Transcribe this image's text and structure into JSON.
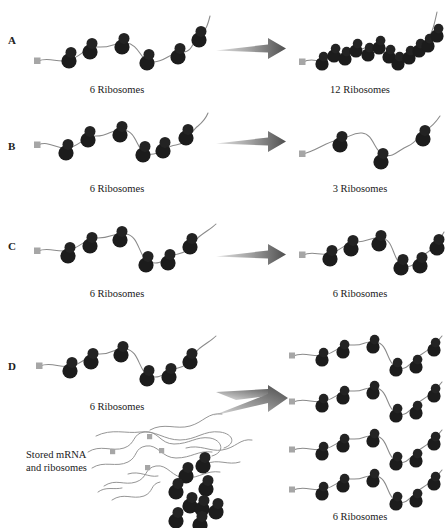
{
  "figure": {
    "background": "#ffffff",
    "ink_color": "#1a1a1a",
    "mrna_color": "#8a8a8a",
    "ribosome_color": "#1c1c1c",
    "cap_color": "#a6a6a6",
    "arrow_color_light": "#d8d8d8",
    "arrow_color_dark": "#5a5a5a"
  },
  "panels": [
    {
      "id": "A",
      "letter": "A",
      "left_caption": "6 Ribosomes",
      "right_caption": "12 Ribosomes",
      "left_ribosomes": 6,
      "right_ribosomes": 12
    },
    {
      "id": "B",
      "letter": "B",
      "left_caption": "6 Ribosomes",
      "right_caption": "3 Ribosomes",
      "left_ribosomes": 6,
      "right_ribosomes": 3
    },
    {
      "id": "C",
      "letter": "C",
      "left_caption": "6 Ribosomes",
      "right_caption": "6 Ribosomes",
      "left_ribosomes": 6,
      "right_ribosomes": 6
    },
    {
      "id": "D",
      "letter": "D",
      "left_caption": "6 Ribosomes",
      "right_caption": "6 Ribosomes",
      "left_ribosomes": 6,
      "right_ribosomes": 6,
      "store_label": "Stored mRNA\nand ribosomes",
      "right_strand_count": 4
    }
  ]
}
